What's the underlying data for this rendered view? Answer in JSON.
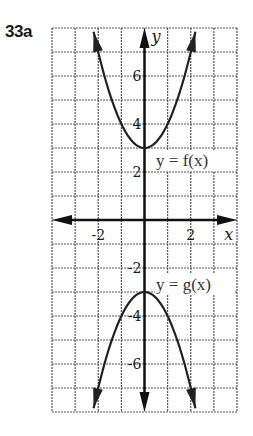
{
  "problem": {
    "label": "33a"
  },
  "chart_data": {
    "type": "line",
    "title": "",
    "xlabel": "x",
    "ylabel": "y",
    "xlim": [
      -4,
      4
    ],
    "ylim": [
      -8,
      8
    ],
    "grid": true,
    "x_ticks": [
      {
        "value": -2,
        "label": "-2"
      },
      {
        "value": 2,
        "label": "2"
      }
    ],
    "y_ticks": [
      {
        "value": 6,
        "label": "6"
      },
      {
        "value": 4,
        "label": "4"
      },
      {
        "value": 2,
        "label": "2"
      },
      {
        "value": -2,
        "label": "-2"
      },
      {
        "value": -4,
        "label": "-4"
      },
      {
        "value": -6,
        "label": "-6"
      }
    ],
    "series": [
      {
        "name": "y = f(x)",
        "expression": "x^2 + 3",
        "vertex": [
          0,
          3
        ],
        "x": [
          -2.2,
          -2,
          -1,
          0,
          1,
          2,
          2.2
        ],
        "y": [
          7.84,
          7,
          4,
          3,
          4,
          7,
          7.84
        ]
      },
      {
        "name": "y = g(x)",
        "expression": "-x^2 - 3",
        "vertex": [
          0,
          -3
        ],
        "x": [
          -2.2,
          -2,
          -1,
          0,
          1,
          2,
          2.2
        ],
        "y": [
          -7.84,
          -7,
          -4,
          -3,
          -4,
          -7,
          -7.84
        ]
      }
    ],
    "annotations": [
      {
        "text": "y = f(x)",
        "x": 0.5,
        "y": 2.5
      },
      {
        "text": "y = g(x)",
        "x": 0.5,
        "y": -2.5
      }
    ]
  }
}
